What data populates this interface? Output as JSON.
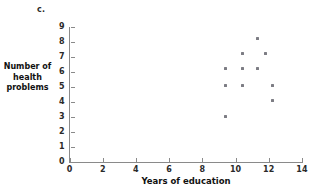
{
  "panel": {
    "label": "c."
  },
  "chart_data": {
    "type": "scatter",
    "title": "",
    "panel_label": "c.",
    "xlabel": "Years of education",
    "ylabel": "Number of health problems",
    "ylabel_lines": [
      "Number of",
      "health",
      "problems"
    ],
    "xlim": [
      0,
      14
    ],
    "ylim": [
      0,
      9
    ],
    "xticks": [
      0,
      2,
      4,
      6,
      8,
      10,
      12,
      14
    ],
    "yticks": [
      0,
      1,
      2,
      3,
      4,
      5,
      6,
      7,
      8,
      9
    ],
    "xtick_labels": [
      "0",
      "2",
      "4",
      "6",
      "8",
      "10",
      "12",
      "14"
    ],
    "ytick_labels": [
      "0",
      "1",
      "2",
      "3",
      "4",
      "5",
      "6",
      "7",
      "8",
      "9"
    ],
    "grid": false,
    "legend": null,
    "marker_color": "#7d7d84",
    "axis_color": "#8a8a8a",
    "points": [
      {
        "x": 9.4,
        "y": 3.0
      },
      {
        "x": 9.4,
        "y": 5.1
      },
      {
        "x": 9.4,
        "y": 6.2
      },
      {
        "x": 10.4,
        "y": 5.1
      },
      {
        "x": 10.4,
        "y": 6.2
      },
      {
        "x": 10.4,
        "y": 7.2
      },
      {
        "x": 11.3,
        "y": 6.2
      },
      {
        "x": 11.3,
        "y": 8.2
      },
      {
        "x": 11.8,
        "y": 7.2
      },
      {
        "x": 12.2,
        "y": 4.1
      },
      {
        "x": 12.2,
        "y": 5.1
      }
    ]
  }
}
